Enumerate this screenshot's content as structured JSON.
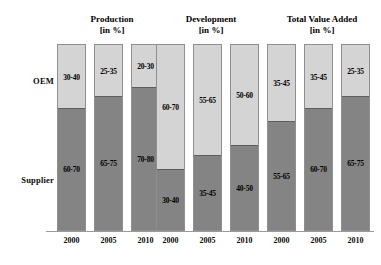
{
  "chart_data": {
    "type": "bar",
    "title": "",
    "subtitle": "",
    "xlabel": "",
    "ylabel": "",
    "ylim": [
      0,
      100
    ],
    "grid": false,
    "legend_position": "left-axis-labels",
    "stacked": true,
    "unit": "%",
    "categories": [
      "2000",
      "2005",
      "2010"
    ],
    "series": [
      {
        "name": "OEM",
        "color": "#d4d4d4"
      },
      {
        "name": "Supplier",
        "color": "#848484"
      }
    ],
    "panels": [
      {
        "title": "Production",
        "unit_label": "[in %]",
        "bars": [
          {
            "category": "2000",
            "oem_label": "30-40",
            "supplier_label": "60-70",
            "oem_value": 35,
            "supplier_value": 65
          },
          {
            "category": "2005",
            "oem_label": "25-35",
            "supplier_label": "65-75",
            "oem_value": 30,
            "supplier_value": 70
          },
          {
            "category": "2010",
            "oem_label": "20-30",
            "supplier_label": "70-80",
            "oem_value": 25,
            "supplier_value": 75
          }
        ]
      },
      {
        "title": "Development",
        "unit_label": "[in %]",
        "bars": [
          {
            "category": "2000",
            "oem_label": "60-70",
            "supplier_label": "30-40",
            "oem_value": 65,
            "supplier_value": 35
          },
          {
            "category": "2005",
            "oem_label": "55-65",
            "supplier_label": "35-45",
            "oem_value": 60,
            "supplier_value": 40
          },
          {
            "category": "2010",
            "oem_label": "50-60",
            "supplier_label": "40-50",
            "oem_value": 55,
            "supplier_value": 45
          }
        ]
      },
      {
        "title": "Total Value Added",
        "unit_label": "[in %]",
        "bars": [
          {
            "category": "2000",
            "oem_label": "35-45",
            "supplier_label": "55-65",
            "oem_value": 40,
            "supplier_value": 60
          },
          {
            "category": "2005",
            "oem_label": "35-45",
            "supplier_label": "60-70",
            "oem_value": 35,
            "supplier_value": 65
          },
          {
            "category": "2010",
            "oem_label": "25-35",
            "supplier_label": "65-75",
            "oem_value": 30,
            "supplier_value": 70
          }
        ]
      }
    ]
  },
  "axis": {
    "oem_label": "OEM",
    "supplier_label": "Supplier"
  },
  "colors": {
    "oem": "#d4d4d4",
    "supplier": "#848484",
    "bar_border": "#8f8f8f",
    "baseline": "#9a9a9a",
    "text": "#000000"
  }
}
